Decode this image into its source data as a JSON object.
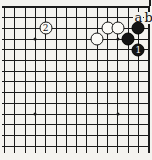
{
  "diagram": {
    "kind": "go board corner diagram",
    "corner": "top-right",
    "paper_color": "#f5f3ef",
    "line_color": "#1b1b1b",
    "grid": {
      "cols": 15,
      "rows": 14,
      "board_edges": [
        "top",
        "right"
      ]
    },
    "stones": [
      {
        "color": "white",
        "label": "2",
        "col": 5,
        "row": 3
      },
      {
        "color": "white",
        "label": "",
        "col": 10,
        "row": 4
      },
      {
        "color": "white",
        "label": "",
        "col": 11,
        "row": 3
      },
      {
        "color": "white",
        "label": "",
        "col": 12,
        "row": 3
      },
      {
        "color": "black",
        "label": "",
        "col": 13,
        "row": 4
      },
      {
        "color": "black",
        "label": "",
        "col": 14,
        "row": 3
      },
      {
        "color": "black",
        "label": "1",
        "col": 14,
        "row": 5
      }
    ],
    "star_points": [
      {
        "col": 4,
        "row": 4
      },
      {
        "col": 12,
        "row": 4
      },
      {
        "col": 4,
        "row": 11
      },
      {
        "col": 12,
        "row": 11
      }
    ],
    "point_labels": [
      {
        "text": "a",
        "col": 14,
        "row": 2
      },
      {
        "text": "b",
        "col": 15,
        "row": 2
      }
    ],
    "stone_colors": {
      "black_fill": "#141414",
      "white_fill": "#fbfaf7",
      "white_number_color": "#111111",
      "black_number_color": "#f6f6f6"
    }
  }
}
